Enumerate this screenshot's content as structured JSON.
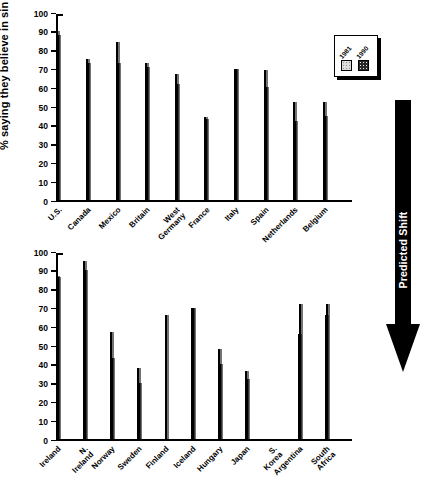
{
  "figure": {
    "y_axis_title": "% saying they believe in sin",
    "annotation": {
      "label": "Predicted Shift",
      "direction": "down",
      "color": "#000000"
    }
  },
  "legend": {
    "position": "top-right",
    "entries": [
      {
        "label": "1981",
        "color": "#dcdcdc",
        "pattern": "light-dotted"
      },
      {
        "label": "1990",
        "color": "#2b2b2b",
        "pattern": "dark-checkered"
      }
    ]
  },
  "chart_data": [
    {
      "id": "panel-top",
      "type": "bar",
      "title": "",
      "xlabel": "",
      "ylabel": "% saying they believe in sin",
      "ylim": [
        0,
        100
      ],
      "yticks": [
        0,
        10,
        20,
        30,
        40,
        50,
        60,
        70,
        80,
        90,
        100
      ],
      "grid": false,
      "legend_position": "top-right",
      "categories": [
        "U.S.",
        "Canada",
        "Mexico",
        "Britain",
        "West\nGermany",
        "France",
        "Italy",
        "Spain",
        "Netherlands",
        "Belgium"
      ],
      "series": [
        {
          "name": "1981",
          "color": "#dcdcdc",
          "values": [
            91,
            76,
            85,
            74,
            68,
            45,
            71,
            70,
            53,
            53
          ]
        },
        {
          "name": "1990",
          "color": "#2b2b2b",
          "values": [
            89,
            74,
            74,
            72,
            63,
            44,
            71,
            61,
            43,
            46
          ]
        }
      ]
    },
    {
      "id": "panel-bottom",
      "type": "bar",
      "title": "",
      "xlabel": "",
      "ylabel": "% saying they believe in sin",
      "ylim": [
        0,
        100
      ],
      "yticks": [
        0,
        10,
        20,
        30,
        40,
        50,
        60,
        70,
        80,
        90,
        100
      ],
      "grid": false,
      "categories": [
        "Ireland",
        "N. Ireland",
        "Norway",
        "Sweden",
        "Finland",
        "Iceland",
        "Hungary",
        "Japan",
        "S. Korea",
        "Argentina",
        "South Africa"
      ],
      "series": [
        {
          "name": "1981",
          "color": "#dcdcdc",
          "values": [
            88,
            96,
            58,
            39,
            null,
            71,
            49,
            37,
            null,
            57,
            67
          ]
        },
        {
          "name": "1990",
          "color": "#2b2b2b",
          "values": [
            87,
            91,
            44,
            31,
            67,
            71,
            41,
            33,
            null,
            73,
            73
          ]
        }
      ]
    }
  ]
}
